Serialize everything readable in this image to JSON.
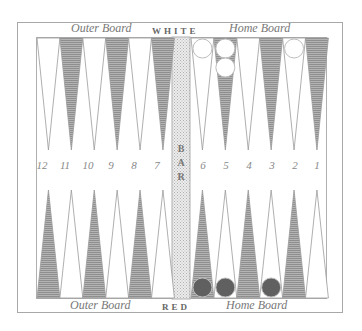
{
  "board": {
    "top_left_label": "Outer Board",
    "top_center_label": "WHITE",
    "top_right_label": "Home Board",
    "bottom_left_label": "Outer Board",
    "bottom_center_label": "RED",
    "bottom_right_label": "Home Board",
    "bar_label": "BAR",
    "bar_letters": [
      "B",
      "A",
      "R"
    ],
    "point_numbers": [
      "12",
      "11",
      "10",
      "9",
      "8",
      "7",
      "6",
      "5",
      "4",
      "3",
      "2",
      "1"
    ],
    "colors": {
      "frame": "#a8a8a8",
      "dark_point": "#a0a0a0",
      "light_point": "#ffffff",
      "bar": "#e2e2e2",
      "white_checker": "#ffffff",
      "red_checker": "#606060"
    },
    "white_checkers": [
      {
        "point": 6,
        "count": 1
      },
      {
        "point": 5,
        "count": 2
      },
      {
        "point": 2,
        "count": 1
      }
    ],
    "red_checkers": [
      {
        "point": 6,
        "count": 1
      },
      {
        "point": 5,
        "count": 1
      },
      {
        "point": 3,
        "count": 1
      }
    ]
  }
}
